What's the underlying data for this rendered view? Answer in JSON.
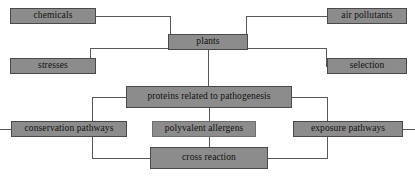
{
  "diagram": {
    "type": "flowchart",
    "colors": {
      "node_fill": "#8c8c8c",
      "node_border": "#4a4a4a",
      "connector": "#595959",
      "text": "#111111",
      "background": "#ffffff"
    },
    "nodes": [
      {
        "id": "chemicals",
        "label": "chemicals",
        "x": 10,
        "y": 8,
        "w": 86,
        "h": 16
      },
      {
        "id": "air",
        "label": "air pollutants",
        "x": 327,
        "y": 8,
        "w": 80,
        "h": 16
      },
      {
        "id": "plants",
        "label": "plants",
        "x": 168,
        "y": 34,
        "w": 80,
        "h": 16
      },
      {
        "id": "stresses",
        "label": "stresses",
        "x": 10,
        "y": 58,
        "w": 86,
        "h": 16
      },
      {
        "id": "selection",
        "label": "selection",
        "x": 327,
        "y": 58,
        "w": 80,
        "h": 16
      },
      {
        "id": "proteins",
        "label": "proteins related to pathogenesis",
        "x": 126,
        "y": 86,
        "w": 166,
        "h": 22
      },
      {
        "id": "conserv",
        "label": "conservation pathways",
        "x": 11,
        "y": 121,
        "w": 116,
        "h": 16
      },
      {
        "id": "polyvalent",
        "label": "polyvalent allergens",
        "x": 152,
        "y": 121,
        "w": 104,
        "h": 16
      },
      {
        "id": "exposure",
        "label": "exposure pathways",
        "x": 293,
        "y": 121,
        "w": 110,
        "h": 16
      },
      {
        "id": "cross",
        "label": "cross reaction",
        "x": 150,
        "y": 147,
        "w": 118,
        "h": 22
      }
    ],
    "edges": [
      {
        "from": "chemicals",
        "to": "plants",
        "path": "M 96 16 L 170 16 L 170 34"
      },
      {
        "from": "air",
        "to": "plants",
        "path": "M 327 16 L 246 16 L 246 34"
      },
      {
        "from": "plants",
        "to": "stresses",
        "path": "M 168 48 L 90 48 L 90 66 L 96 66"
      },
      {
        "from": "plants",
        "to": "selection",
        "path": "M 248 48 L 326 48 L 326 66 L 327 66"
      },
      {
        "from": "plants",
        "to": "proteins",
        "path": "M 208 50 L 208 86"
      },
      {
        "from": "proteins",
        "to": "conserv",
        "path": "M 126 97 L 92 97 L 92 158 L 150 158"
      },
      {
        "from": "proteins",
        "to": "exposure",
        "path": "M 292 97 L 327 97 L 327 158 L 268 158"
      },
      {
        "from": "proteins",
        "to": "cross",
        "path": "M 209 108 L 209 147"
      },
      {
        "from": "conserv",
        "to": "left-bus",
        "path": "M 11 129 L 0 129"
      },
      {
        "from": "exposure",
        "to": "right-bus",
        "path": "M 403 129 L 415 129"
      },
      {
        "from": "cross",
        "to": "left-bus",
        "path": "M 150 158 L 120 158"
      },
      {
        "from": "cross",
        "to": "right-bus",
        "path": "M 268 158 L 300 158"
      }
    ]
  }
}
